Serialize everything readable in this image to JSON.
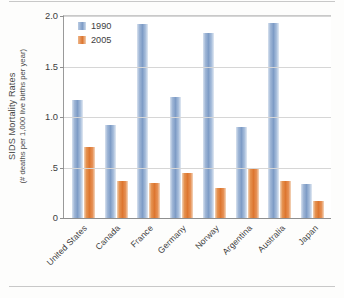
{
  "chart_data": {
    "type": "bar",
    "title": "",
    "xlabel": "",
    "ylabel": "SIDS Mortality Rates",
    "ylabel_sub": "(# deaths per 1,000 live births per year)",
    "categories": [
      "United States",
      "Canada",
      "France",
      "Germany",
      "Norway",
      "Argentina",
      "Australia",
      "Japan"
    ],
    "series": [
      {
        "name": "1990",
        "color": "#7e9cc6",
        "values": [
          1.17,
          0.92,
          1.92,
          1.2,
          1.83,
          0.9,
          1.93,
          0.34
        ]
      },
      {
        "name": "2005",
        "color": "#dd7630",
        "values": [
          0.7,
          0.37,
          0.35,
          0.45,
          0.3,
          0.5,
          0.37,
          0.17
        ]
      }
    ],
    "ylim": [
      0,
      2.0
    ],
    "yticks": [
      0,
      0.5,
      1.0,
      1.5,
      2.0
    ],
    "ytick_labels": [
      "0",
      ".5",
      "1.0",
      "1.5",
      "2.0"
    ],
    "grid": true,
    "legend_position": "top-left"
  },
  "axis": {
    "y_title_main": "SIDS Mortality Rates",
    "y_title_sub": "(# deaths per 1,000 live births per year)"
  }
}
